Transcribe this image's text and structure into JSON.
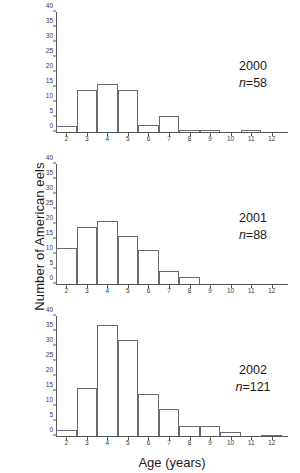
{
  "figure": {
    "xlabel": "Age (years)",
    "ylabel": "Number of American eels"
  },
  "chart_data": {
    "type": "bar",
    "title": "",
    "xlabel": "Age (years)",
    "ylabel": "Number of American eels",
    "xlim": [
      1.5,
      12.5
    ],
    "ylim": [
      0,
      40
    ],
    "yticks": [
      0,
      5,
      10,
      15,
      20,
      25,
      30,
      35,
      40
    ],
    "xticks": [
      2,
      3,
      4,
      5,
      6,
      7,
      8,
      9,
      10,
      11,
      12
    ],
    "grid": false,
    "legend": "none",
    "bin_width": 1,
    "categories": [
      2,
      3,
      4,
      5,
      6,
      7,
      8,
      9,
      10,
      11,
      12
    ],
    "panels": [
      {
        "year": "2000",
        "n_label": "n",
        "n_value": "=58",
        "n_text": "n=58",
        "values": [
          2,
          14,
          16,
          14,
          2.5,
          5.5,
          0.8,
          0.8,
          0,
          0.8,
          0
        ]
      },
      {
        "year": "2001",
        "n_label": "n",
        "n_value": "=88",
        "n_text": "n=88",
        "values": [
          12,
          19,
          21,
          16,
          11.5,
          4.5,
          2.3,
          0,
          0,
          0,
          0
        ]
      },
      {
        "year": "2002",
        "n_label": "n",
        "n_value": "=121",
        "n_text": "n=121",
        "values": [
          2,
          16,
          37,
          32,
          14,
          9,
          3.5,
          3.5,
          1.5,
          0,
          0.5
        ]
      }
    ]
  },
  "colors": {
    "bar_stroke": "#6a6c6f",
    "axis": "#55575a",
    "text": "#1a1a1a",
    "background": "#ffffff"
  }
}
